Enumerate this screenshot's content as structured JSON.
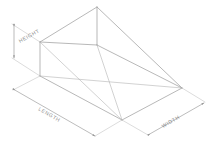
{
  "drawing": {
    "title": "Isometric wedge dimension drawing",
    "style": {
      "background_color": "#ffffff",
      "line_color": "#9a9a9a",
      "hidden_line_color": "#b4b4b4",
      "dimension_line_color": "#8f8f8f",
      "text_color": "#8b8b8b"
    },
    "dimensions": [
      {
        "id": "height",
        "label": "HEIGHT",
        "orientation": "vertical",
        "position": "left"
      },
      {
        "id": "length",
        "label": "LENGTH",
        "orientation": "oblique-down-right",
        "position": "bottom-left"
      },
      {
        "id": "width",
        "label": "WIDTH",
        "orientation": "oblique-up-right",
        "position": "bottom-right"
      }
    ]
  }
}
